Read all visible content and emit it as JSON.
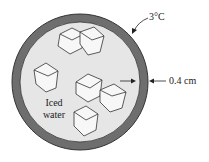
{
  "diagram": {
    "labels": {
      "temperature": "3°C",
      "thickness": "0.4 cm",
      "contents_line1": "Iced",
      "contents_line2": "water"
    },
    "colors": {
      "shell": "#6e6e6e",
      "interior": "#e6e6e6",
      "ice_outline": "#333333",
      "text": "#222222"
    },
    "geometry": {
      "center": [
        80,
        82
      ],
      "outer_radius": 68,
      "inner_radius": 60
    }
  }
}
